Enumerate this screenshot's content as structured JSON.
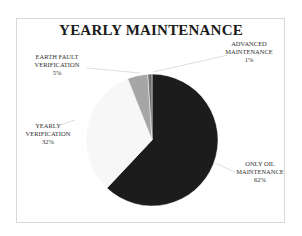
{
  "chart_data": {
    "type": "pie",
    "title": "YEARLY MAINTENANCE",
    "categories": [
      "ONLY OIL MAINTENANCE",
      "YEARLY VERIFICATION",
      "EARTH FAULT VERIFICATION",
      "ADVANCED MAINTENANCE"
    ],
    "values": [
      62,
      32,
      5,
      1
    ],
    "value_labels": [
      "62%",
      "32%",
      "5%",
      "1%"
    ],
    "colors": [
      "#1c1c1c",
      "#f7f7f7",
      "#a6a6a6",
      "#6e6e6e"
    ],
    "legend": "none",
    "start_angle_deg": 0,
    "direction": "clockwise"
  },
  "labels": {
    "oil": {
      "name": "ONLY OIL",
      "name2": "MAINTENANCE",
      "pct": "62%"
    },
    "yearly": {
      "name": "YEARLY",
      "name2": "VERIFICATION",
      "pct": "32%"
    },
    "earth": {
      "name": "EARTH FAULT",
      "name2": "VERIFICATION",
      "pct": "5%"
    },
    "advanced": {
      "name": "ADVANCED",
      "name2": "MAINTENANCE",
      "pct": "1%"
    }
  }
}
